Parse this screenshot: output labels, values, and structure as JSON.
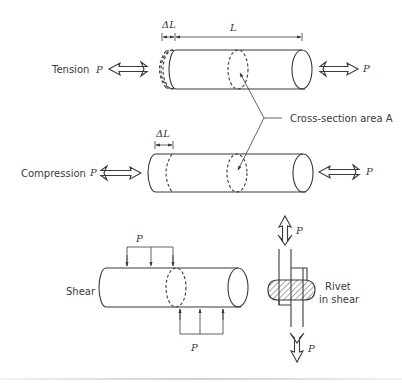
{
  "diagram": {
    "labels": {
      "tension": "Tension",
      "compression": "Compression",
      "shear": "Shear",
      "cross_section": "Cross-section area A",
      "rivet_line1": "Rivet",
      "rivet_line2": "in shear",
      "force": "P",
      "delta_length": "ΔL",
      "length": "L"
    },
    "colors": {
      "stroke": "#3a3a3a",
      "background": "#ffffff",
      "hatch": "#3a3a3a"
    },
    "sections": [
      {
        "name": "tension",
        "force_direction": "outward"
      },
      {
        "name": "compression",
        "force_direction": "inward"
      },
      {
        "name": "shear",
        "force_direction": "transverse"
      },
      {
        "name": "rivet-in-shear",
        "force_direction": "axial-opposed"
      }
    ]
  }
}
